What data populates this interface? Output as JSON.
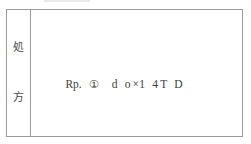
{
  "document": {
    "type": "prescription-table",
    "border_color": "#9a9a9a",
    "background_color": "#ffffff",
    "text_color": "#3d3d3d"
  },
  "label_column": {
    "name": "処方",
    "meaning_chars": [
      "処",
      "方"
    ],
    "top_char": "処",
    "bottom_char": "方"
  },
  "prescription": {
    "rp_label": "Rp.",
    "item_number": "①",
    "drug": "d o",
    "multiplier_sign": "×",
    "quantity": "1 4",
    "unit": "T D",
    "full_line": "Rp. ① d o×1 4 T D"
  }
}
